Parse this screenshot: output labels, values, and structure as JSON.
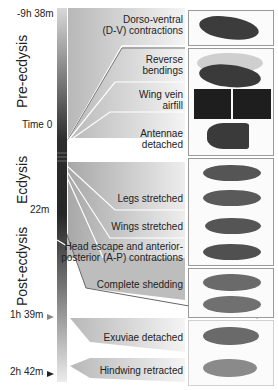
{
  "figure": {
    "timeline": {
      "times": [
        {
          "label": "-9h 38m",
          "y": 12
        },
        {
          "label": "Time 0",
          "y": 124
        },
        {
          "label": "22m",
          "y": 209
        },
        {
          "label": "1h 39m",
          "y": 314
        },
        {
          "label": "2h 42m",
          "y": 371
        }
      ],
      "phases": [
        {
          "label": "Pre-ecdysis"
        },
        {
          "label": "Ecdysis"
        },
        {
          "label": "Post-ecdysis"
        }
      ]
    },
    "stages": [
      {
        "label_line1": "Dorso-ventral",
        "label_line2": "(D-V) contractions"
      },
      {
        "label_line1": "Reverse",
        "label_line2": "bendings"
      },
      {
        "label_line1": "Wing vein",
        "label_line2": "airfill"
      },
      {
        "label_line1": "Antennae",
        "label_line2": "detached"
      },
      {
        "label_line1": "Legs stretched",
        "label_line2": ""
      },
      {
        "label_line1": "Wings stretched",
        "label_line2": ""
      },
      {
        "label_line1": "Head escape and anterior-",
        "label_line2": "posterior (A-P) contractions"
      },
      {
        "label_line1": "Complete shedding",
        "label_line2": ""
      },
      {
        "label_line1": "Exuviae detached",
        "label_line2": ""
      },
      {
        "label_line1": "Hindwing retracted",
        "label_line2": ""
      }
    ],
    "colors": {
      "bar_dark": "#2a2a2a",
      "bar_light": "#e6e6e6",
      "band": "#c8c8c8",
      "panel_border": "#9a9a9a",
      "bug": "#4a4a4a"
    }
  }
}
